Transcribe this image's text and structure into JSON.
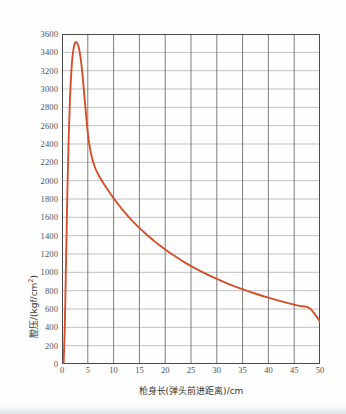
{
  "figure": {
    "background": "#fefefe",
    "curve_color": "#d4502a",
    "grid_color_major": "#6e6e70",
    "grid_color_minor": "#b9b9bb",
    "axis_color": "#4a4a4c"
  },
  "axis_titles": {
    "x": "枪身长(弹头前进距离)/cm",
    "y_main": "膛压/(kgf/cm",
    "y_sup": "2",
    "y_tail": ")"
  },
  "ticks": {
    "y": [
      "3600",
      "3400",
      "3200",
      "3000",
      "2800",
      "2600",
      "2400",
      "2200",
      "2000",
      "1800",
      "1600",
      "1400",
      "1200",
      "1000",
      "800",
      "600",
      "400",
      "200",
      "0"
    ],
    "x": [
      "0",
      "5",
      "10",
      "15",
      "20",
      "25",
      "30",
      "35",
      "40",
      "45",
      "50"
    ]
  },
  "chart_data": {
    "type": "line",
    "title": "",
    "xlabel": "枪身长(弹头前进距离)/cm",
    "ylabel": "膛压/(kgf/cm²)",
    "xlim": [
      0,
      50
    ],
    "ylim": [
      0,
      3600
    ],
    "xtick_step": 5,
    "ytick_step": 200,
    "grid": true,
    "legend": "none",
    "series": [
      {
        "name": "膛压曲线",
        "color": "#d4502a",
        "x": [
          0.3,
          0.55,
          0.8,
          1.05,
          1.3,
          1.55,
          1.8,
          2.05,
          2.3,
          2.55,
          2.8,
          3.05,
          3.3,
          3.55,
          3.8,
          4.05,
          4.3,
          4.6,
          5.0,
          5.5,
          6.0,
          6.5,
          7.0,
          7.5,
          8.0,
          9.0,
          10.0,
          11.0,
          12.0,
          13.0,
          14.0,
          15.0,
          16.0,
          17.0,
          18.0,
          19.0,
          20.0,
          22.0,
          24.0,
          26.0,
          28.0,
          30.0,
          32.0,
          34.0,
          36.0,
          38.0,
          40.0,
          42.0,
          44.0,
          46.0,
          48.0,
          50.0
        ],
        "y": [
          0,
          420,
          1180,
          1900,
          2480,
          2900,
          3180,
          3360,
          3460,
          3505,
          3510,
          3490,
          3440,
          3360,
          3250,
          3110,
          2950,
          2760,
          2520,
          2330,
          2210,
          2130,
          2070,
          2020,
          1975,
          1890,
          1810,
          1735,
          1665,
          1600,
          1540,
          1485,
          1432,
          1382,
          1335,
          1292,
          1250,
          1172,
          1100,
          1038,
          980,
          928,
          880,
          836,
          796,
          758,
          724,
          692,
          662,
          634,
          608,
          465
        ]
      }
    ],
    "annotations": {
      "peak_value": 3510,
      "peak_x": 2.8,
      "end_value": 465,
      "end_x": 50
    }
  }
}
